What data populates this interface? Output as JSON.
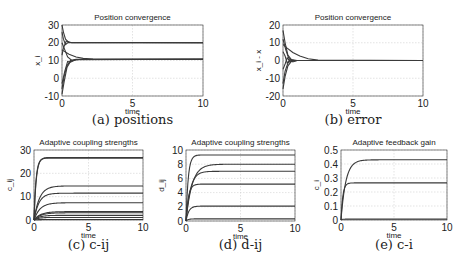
{
  "chart_data": [
    {
      "id": "a",
      "type": "line",
      "title": "Position convergence",
      "xlabel": "time",
      "ylabel": "x_i",
      "caption": "(a) positions",
      "xlim": [
        0,
        10
      ],
      "ylim": [
        -10,
        30
      ],
      "xticks": [
        0,
        5,
        10
      ],
      "yticks": [
        -10,
        0,
        10,
        20,
        30
      ],
      "grid": true,
      "box": {
        "left": 62,
        "top": 25,
        "right": 203,
        "bottom": 96
      },
      "series": [
        {
          "name": "x1",
          "x": [
            0,
            0.1,
            0.25,
            0.45,
            0.7,
            10
          ],
          "y": [
            30,
            26,
            22,
            20.5,
            20,
            20
          ]
        },
        {
          "name": "x2",
          "x": [
            0,
            0.1,
            0.3,
            0.5,
            10
          ],
          "y": [
            13,
            17,
            21,
            20.3,
            20
          ]
        },
        {
          "name": "x3",
          "x": [
            0,
            0.1,
            0.25,
            0.45,
            0.7,
            10
          ],
          "y": [
            26,
            22,
            19,
            20.2,
            20,
            20
          ]
        },
        {
          "name": "x4",
          "x": [
            0,
            0.2,
            0.5,
            1.0,
            1.5,
            2.2,
            10
          ],
          "y": [
            16,
            15,
            13.5,
            12,
            11.2,
            10.8,
            10.7
          ]
        },
        {
          "name": "x5",
          "x": [
            0,
            0.15,
            0.35,
            0.6,
            1.0,
            10
          ],
          "y": [
            -9,
            -2,
            6,
            9.5,
            10.6,
            10.7
          ]
        },
        {
          "name": "x6",
          "x": [
            0,
            0.15,
            0.35,
            0.6,
            1.0,
            10
          ],
          "y": [
            -6,
            1,
            7,
            10,
            10.7,
            10.7
          ]
        },
        {
          "name": "x7",
          "x": [
            0,
            0.2,
            0.4,
            0.7,
            1.2,
            10
          ],
          "y": [
            20,
            16,
            12,
            10,
            10.6,
            10.7
          ]
        },
        {
          "name": "x8",
          "x": [
            0,
            0.2,
            0.4,
            0.6,
            1.0,
            10
          ],
          "y": [
            -3,
            4,
            9.5,
            9,
            10.5,
            10.7
          ]
        }
      ]
    },
    {
      "id": "b",
      "type": "line",
      "title": "Position convergence",
      "xlabel": "time",
      "ylabel": "x_i - x",
      "caption": "(b) error",
      "xlim": [
        0,
        10
      ],
      "ylim": [
        -20,
        20
      ],
      "xticks": [
        0,
        5,
        10
      ],
      "yticks": [
        -20,
        -10,
        0,
        10,
        20
      ],
      "grid": true,
      "box": {
        "left": 283,
        "top": 25,
        "right": 423,
        "bottom": 96
      },
      "series": [
        {
          "name": "e1",
          "x": [
            0,
            0.15,
            0.35,
            0.6,
            1.0,
            10
          ],
          "y": [
            17,
            10,
            3,
            0.5,
            0,
            0
          ]
        },
        {
          "name": "e2",
          "x": [
            0,
            0.3,
            0.7,
            1.2,
            1.8,
            2.5,
            10
          ],
          "y": [
            9,
            7,
            4.5,
            2.5,
            1,
            0.2,
            0
          ]
        },
        {
          "name": "e3",
          "x": [
            0,
            0.15,
            0.35,
            0.6,
            1.0,
            10
          ],
          "y": [
            -16,
            -9,
            -3,
            -0.5,
            0,
            0
          ]
        },
        {
          "name": "e4",
          "x": [
            0,
            0.15,
            0.35,
            0.6,
            1.0,
            10
          ],
          "y": [
            -13,
            -6,
            -1.5,
            0,
            0,
            0
          ]
        },
        {
          "name": "e5",
          "x": [
            0,
            0.15,
            0.3,
            0.5,
            0.8,
            10
          ],
          "y": [
            5,
            2.5,
            -1.5,
            0.5,
            0,
            0
          ]
        },
        {
          "name": "e6",
          "x": [
            0,
            0.15,
            0.3,
            0.5,
            0.8,
            10
          ],
          "y": [
            -5,
            -2,
            1.5,
            -0.5,
            0,
            0
          ]
        },
        {
          "name": "e7",
          "x": [
            0,
            0.2,
            0.4,
            0.7,
            1.0,
            10
          ],
          "y": [
            12,
            6,
            1.5,
            -0.8,
            0,
            0
          ]
        }
      ]
    },
    {
      "id": "c",
      "type": "line",
      "title": "Adaptive coupling strengths",
      "xlabel": "time",
      "ylabel": "c_ij",
      "caption": "(c) c-ij",
      "xlim": [
        0,
        10
      ],
      "ylim": [
        0,
        30
      ],
      "xticks": [
        0,
        5,
        10
      ],
      "yticks": [
        0,
        10,
        20,
        30
      ],
      "grid": true,
      "box": {
        "left": 34,
        "top": 150,
        "right": 143,
        "bottom": 220
      },
      "series": [
        {
          "name": "c1",
          "final": 26.5,
          "rise": 0.18
        },
        {
          "name": "c2",
          "final": 26.8,
          "rise": 0.2
        },
        {
          "name": "c3",
          "final": 14.6,
          "rise": 0.5
        },
        {
          "name": "c4",
          "final": 11.5,
          "rise": 0.45
        },
        {
          "name": "c5",
          "final": 7.4,
          "rise": 0.55
        },
        {
          "name": "c6",
          "final": 3.6,
          "rise": 0.6
        },
        {
          "name": "c7",
          "final": 3.1,
          "rise": 0.6
        },
        {
          "name": "c8",
          "final": 2.0,
          "rise": 0.5
        },
        {
          "name": "c9",
          "final": 1.1,
          "rise": 0.4
        },
        {
          "name": "c10",
          "final": 0.2,
          "rise": 0.3
        }
      ]
    },
    {
      "id": "d",
      "type": "line",
      "title": "Adaptive coupling strengths",
      "xlabel": "time",
      "ylabel": "d_ij",
      "caption": "(d) d-ij",
      "xlim": [
        0,
        10
      ],
      "ylim": [
        0,
        10
      ],
      "xticks": [
        0,
        5,
        10
      ],
      "yticks": [
        0,
        2,
        4,
        6,
        8,
        10
      ],
      "grid": true,
      "box": {
        "left": 186,
        "top": 150,
        "right": 295,
        "bottom": 221
      },
      "series": [
        {
          "name": "d1",
          "final": 9.3,
          "rise": 0.2
        },
        {
          "name": "d2",
          "final": 8.0,
          "rise": 0.55
        },
        {
          "name": "d3",
          "final": 7.0,
          "rise": 0.4
        },
        {
          "name": "d4",
          "final": 5.2,
          "rise": 0.22
        },
        {
          "name": "d5",
          "final": 2.1,
          "rise": 0.25
        },
        {
          "name": "d6",
          "final": 0.3,
          "rise": 0.2
        }
      ]
    },
    {
      "id": "e",
      "type": "line",
      "title": "Adaptive feedback gain",
      "xlabel": "time",
      "ylabel": "c_i",
      "caption": "(e) c-i",
      "xlim": [
        0,
        10
      ],
      "ylim": [
        0,
        0.5
      ],
      "xticks": [
        0,
        5,
        10
      ],
      "yticks": [
        0,
        0.1,
        0.2,
        0.3,
        0.4,
        0.5
      ],
      "grid": true,
      "box": {
        "left": 341,
        "top": 150,
        "right": 447,
        "bottom": 220
      },
      "series": [
        {
          "name": "g1",
          "final": 0.43,
          "rise": 0.45
        },
        {
          "name": "g2",
          "final": 0.265,
          "rise": 0.17
        },
        {
          "name": "g3",
          "final": 0.006,
          "rise": 0.1
        }
      ]
    }
  ],
  "colors": {
    "line": "#3a3a3a",
    "axis": "#333333",
    "grid": "#d0d0d0"
  }
}
